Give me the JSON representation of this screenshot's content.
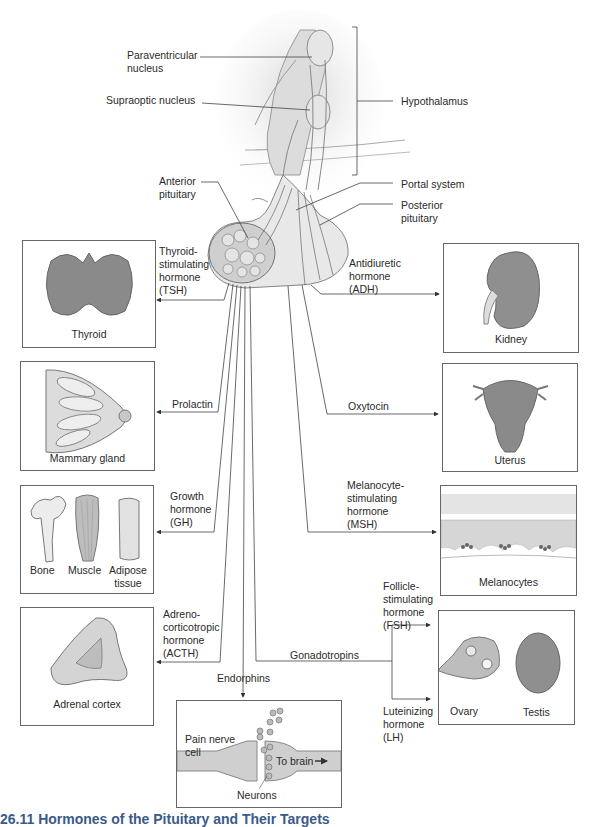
{
  "figure": {
    "caption": "26.11 Hormones of the Pituitary and Their Targets"
  },
  "anatomy_labels": {
    "paraventricular": "Paraventricular\nnucleus",
    "supraoptic": "Supraoptic nucleus",
    "hypothalamus": "Hypothalamus",
    "anterior_pituitary": "Anterior\npituitary",
    "portal_system": "Portal system",
    "posterior_pituitary": "Posterior\npituitary"
  },
  "hormones": {
    "tsh": "Thyroid-\nstimulating\nhormone\n(TSH)",
    "prolactin": "Prolactin",
    "gh": "Growth\nhormone\n(GH)",
    "acth": "Adreno-\ncorticotropic\nhormone\n(ACTH)",
    "endorphins": "Endorphins",
    "gonadotropins": "Gonadotropins",
    "fsh": "Follicle-\nstimulating\nhormone\n(FSH)",
    "lh": "Luteinizing\nhormone\n(LH)",
    "adh": "Antidiuretic\nhormone\n(ADH)",
    "oxytocin": "Oxytocin",
    "msh": "Melanocyte-\nstimulating\nhormone\n(MSH)"
  },
  "targets": {
    "thyroid": "Thyroid",
    "mammary": "Mammary gland",
    "bone": "Bone",
    "muscle": "Muscle",
    "adipose": "Adipose\ntissue",
    "adrenal": "Adrenal cortex",
    "pain_cell": "Pain nerve\ncell",
    "to_brain": "To brain",
    "neurons": "Neurons",
    "kidney": "Kidney",
    "uterus": "Uterus",
    "melanocytes": "Melanocytes",
    "ovary": "Ovary",
    "testis": "Testis"
  },
  "colors": {
    "line": "#444444",
    "organ_fill": "#8a8a8a",
    "tissue_fill": "#cfcfcf",
    "caption": "#3a5a8a"
  }
}
